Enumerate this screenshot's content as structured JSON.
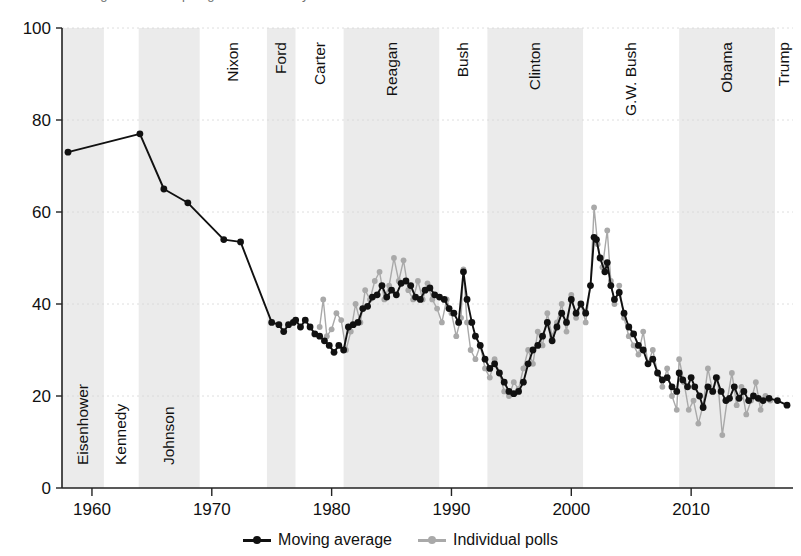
{
  "top_cut_text": "is this data straight from Gallup Organization surveys",
  "legend": {
    "series": [
      {
        "name": "moving-average",
        "label": "Moving average",
        "color": "#111111"
      },
      {
        "name": "individual-polls",
        "label": "Individual polls",
        "color": "#a9a9a9"
      }
    ]
  },
  "chart_data": {
    "type": "line",
    "title": "",
    "xlabel": "",
    "ylabel": "",
    "xlim": [
      1957.5,
      2018.5
    ],
    "ylim": [
      0,
      100
    ],
    "grid": true,
    "grid_axis": "y",
    "legend_position": "bottom-center",
    "xticks": [
      1960,
      1970,
      1980,
      1990,
      2000,
      2010
    ],
    "yticks": [
      0,
      20,
      40,
      60,
      80,
      100
    ],
    "band_colors": {
      "shaded": "#ebebeb",
      "plain": "#ffffff"
    },
    "presidential_bands": [
      {
        "label": "Eisenhower",
        "start": 1957.5,
        "end": 1961.0,
        "shaded": true
      },
      {
        "label": "Kennedy",
        "start": 1961.0,
        "end": 1963.9,
        "shaded": false
      },
      {
        "label": "Johnson",
        "start": 1963.9,
        "end": 1969.0,
        "shaded": true
      },
      {
        "label": "Nixon",
        "start": 1969.0,
        "end": 1974.6,
        "shaded": false
      },
      {
        "label": "Ford",
        "start": 1974.6,
        "end": 1977.0,
        "shaded": true
      },
      {
        "label": "Carter",
        "start": 1977.0,
        "end": 1981.0,
        "shaded": false
      },
      {
        "label": "Reagan",
        "start": 1981.0,
        "end": 1989.0,
        "shaded": true
      },
      {
        "label": "Bush",
        "start": 1989.0,
        "end": 1993.0,
        "shaded": false
      },
      {
        "label": "Clinton",
        "start": 1993.0,
        "end": 2001.0,
        "shaded": true
      },
      {
        "label": "G.W. Bush",
        "start": 2001.0,
        "end": 2009.0,
        "shaded": false
      },
      {
        "label": "Obama",
        "start": 2009.0,
        "end": 2017.0,
        "shaded": true
      },
      {
        "label": "Trump",
        "start": 2017.0,
        "end": 2018.5,
        "shaded": false
      }
    ],
    "series": [
      {
        "name": "Individual polls",
        "color": "#a9a9a9",
        "marker": "circle",
        "points": [
          [
            1979.0,
            35.0
          ],
          [
            1979.3,
            41.0
          ],
          [
            1979.6,
            33.0
          ],
          [
            1980.0,
            34.5
          ],
          [
            1980.4,
            38.0
          ],
          [
            1980.8,
            36.5
          ],
          [
            1981.2,
            30.0
          ],
          [
            1981.6,
            34.0
          ],
          [
            1982.0,
            40.0
          ],
          [
            1982.4,
            36.0
          ],
          [
            1982.8,
            43.0
          ],
          [
            1983.2,
            41.0
          ],
          [
            1983.6,
            45.0
          ],
          [
            1984.0,
            47.0
          ],
          [
            1984.4,
            41.0
          ],
          [
            1984.8,
            44.0
          ],
          [
            1985.2,
            50.0
          ],
          [
            1985.6,
            45.0
          ],
          [
            1986.0,
            49.5
          ],
          [
            1986.4,
            43.0
          ],
          [
            1986.8,
            41.0
          ],
          [
            1987.2,
            45.0
          ],
          [
            1987.6,
            41.0
          ],
          [
            1988.0,
            44.5
          ],
          [
            1988.4,
            41.0
          ],
          [
            1988.8,
            39.0
          ],
          [
            1989.2,
            36.0
          ],
          [
            1989.6,
            41.0
          ],
          [
            1990.0,
            38.0
          ],
          [
            1990.4,
            33.0
          ],
          [
            1990.8,
            37.0
          ],
          [
            1991.0,
            47.5
          ],
          [
            1991.3,
            36.0
          ],
          [
            1991.6,
            30.0
          ],
          [
            1992.0,
            28.0
          ],
          [
            1992.4,
            31.0
          ],
          [
            1992.8,
            26.0
          ],
          [
            1993.2,
            24.0
          ],
          [
            1993.6,
            28.0
          ],
          [
            1994.0,
            25.0
          ],
          [
            1994.4,
            21.0
          ],
          [
            1994.8,
            20.0
          ],
          [
            1995.2,
            23.0
          ],
          [
            1995.6,
            21.5
          ],
          [
            1996.0,
            26.0
          ],
          [
            1996.4,
            30.0
          ],
          [
            1996.8,
            27.0
          ],
          [
            1997.2,
            34.0
          ],
          [
            1997.6,
            31.0
          ],
          [
            1998.0,
            38.0
          ],
          [
            1998.4,
            33.0
          ],
          [
            1998.8,
            36.0
          ],
          [
            1999.2,
            40.0
          ],
          [
            1999.6,
            34.0
          ],
          [
            2000.0,
            42.0
          ],
          [
            2000.4,
            37.0
          ],
          [
            2000.8,
            40.0
          ],
          [
            2001.2,
            36.0
          ],
          [
            2001.6,
            44.0
          ],
          [
            2001.9,
            61.0
          ],
          [
            2002.2,
            53.0
          ],
          [
            2002.6,
            48.0
          ],
          [
            2003.0,
            56.0
          ],
          [
            2003.3,
            45.0
          ],
          [
            2003.6,
            40.0
          ],
          [
            2004.0,
            44.0
          ],
          [
            2004.4,
            37.0
          ],
          [
            2004.8,
            33.0
          ],
          [
            2005.2,
            31.0
          ],
          [
            2005.6,
            29.0
          ],
          [
            2006.0,
            34.0
          ],
          [
            2006.4,
            27.0
          ],
          [
            2006.8,
            30.0
          ],
          [
            2007.2,
            25.0
          ],
          [
            2007.6,
            22.0
          ],
          [
            2008.0,
            26.0
          ],
          [
            2008.4,
            20.0
          ],
          [
            2008.8,
            17.0
          ],
          [
            2009.0,
            28.0
          ],
          [
            2009.4,
            23.0
          ],
          [
            2009.8,
            17.0
          ],
          [
            2010.2,
            19.0
          ],
          [
            2010.6,
            14.0
          ],
          [
            2011.0,
            18.0
          ],
          [
            2011.4,
            26.0
          ],
          [
            2011.8,
            21.0
          ],
          [
            2012.2,
            24.0
          ],
          [
            2012.6,
            11.5
          ],
          [
            2013.0,
            19.0
          ],
          [
            2013.4,
            25.0
          ],
          [
            2013.8,
            18.0
          ],
          [
            2014.2,
            22.0
          ],
          [
            2014.6,
            16.0
          ],
          [
            2015.0,
            19.0
          ],
          [
            2015.4,
            23.0
          ],
          [
            2015.8,
            17.0
          ],
          [
            2016.2,
            20.0
          ],
          [
            2016.6,
            19.0
          ]
        ]
      },
      {
        "name": "Moving average",
        "color": "#111111",
        "marker": "circle",
        "points": [
          [
            1958.0,
            73.0
          ],
          [
            1964.0,
            77.0
          ],
          [
            1966.0,
            65.0
          ],
          [
            1968.0,
            62.0
          ],
          [
            1971.0,
            54.0
          ],
          [
            1972.4,
            53.5
          ],
          [
            1975.0,
            36.0
          ],
          [
            1975.6,
            35.5
          ],
          [
            1976.0,
            34.0
          ],
          [
            1976.4,
            35.5
          ],
          [
            1976.8,
            36.0
          ],
          [
            1977.0,
            36.5
          ],
          [
            1977.4,
            35.0
          ],
          [
            1977.8,
            36.5
          ],
          [
            1978.2,
            35.0
          ],
          [
            1978.6,
            33.5
          ],
          [
            1979.0,
            33.0
          ],
          [
            1979.4,
            32.0
          ],
          [
            1979.8,
            31.0
          ],
          [
            1980.2,
            29.5
          ],
          [
            1980.6,
            31.0
          ],
          [
            1981.0,
            30.0
          ],
          [
            1981.4,
            35.0
          ],
          [
            1981.8,
            35.5
          ],
          [
            1982.2,
            36.0
          ],
          [
            1982.6,
            39.0
          ],
          [
            1983.0,
            39.5
          ],
          [
            1983.4,
            41.5
          ],
          [
            1983.8,
            42.0
          ],
          [
            1984.2,
            44.0
          ],
          [
            1984.6,
            41.5
          ],
          [
            1985.0,
            43.0
          ],
          [
            1985.4,
            42.0
          ],
          [
            1985.8,
            44.5
          ],
          [
            1986.2,
            45.0
          ],
          [
            1986.6,
            44.0
          ],
          [
            1987.0,
            41.5
          ],
          [
            1987.4,
            41.0
          ],
          [
            1987.8,
            43.0
          ],
          [
            1988.2,
            43.5
          ],
          [
            1988.6,
            42.0
          ],
          [
            1989.0,
            41.5
          ],
          [
            1989.4,
            41.0
          ],
          [
            1989.8,
            39.0
          ],
          [
            1990.2,
            38.0
          ],
          [
            1990.6,
            36.0
          ],
          [
            1991.0,
            47.0
          ],
          [
            1991.3,
            41.0
          ],
          [
            1991.7,
            36.0
          ],
          [
            1992.0,
            33.0
          ],
          [
            1992.4,
            31.0
          ],
          [
            1992.8,
            28.0
          ],
          [
            1993.2,
            26.0
          ],
          [
            1993.6,
            27.0
          ],
          [
            1994.0,
            25.0
          ],
          [
            1994.4,
            23.0
          ],
          [
            1994.8,
            21.0
          ],
          [
            1995.2,
            20.5
          ],
          [
            1995.6,
            21.0
          ],
          [
            1996.0,
            23.0
          ],
          [
            1996.4,
            27.0
          ],
          [
            1996.8,
            30.0
          ],
          [
            1997.2,
            31.0
          ],
          [
            1997.6,
            33.0
          ],
          [
            1998.0,
            36.0
          ],
          [
            1998.4,
            32.0
          ],
          [
            1998.8,
            35.0
          ],
          [
            1999.2,
            38.0
          ],
          [
            1999.6,
            36.0
          ],
          [
            2000.0,
            41.0
          ],
          [
            2000.4,
            38.0
          ],
          [
            2000.8,
            40.0
          ],
          [
            2001.2,
            38.0
          ],
          [
            2001.6,
            44.0
          ],
          [
            2001.9,
            54.5
          ],
          [
            2002.1,
            54.0
          ],
          [
            2002.4,
            50.0
          ],
          [
            2002.8,
            47.0
          ],
          [
            2003.0,
            49.0
          ],
          [
            2003.3,
            44.0
          ],
          [
            2003.6,
            41.0
          ],
          [
            2004.0,
            42.5
          ],
          [
            2004.4,
            38.0
          ],
          [
            2004.8,
            35.0
          ],
          [
            2005.2,
            33.5
          ],
          [
            2005.6,
            31.0
          ],
          [
            2006.0,
            30.0
          ],
          [
            2006.4,
            27.0
          ],
          [
            2006.8,
            28.0
          ],
          [
            2007.2,
            25.0
          ],
          [
            2007.6,
            23.5
          ],
          [
            2008.0,
            24.0
          ],
          [
            2008.4,
            22.0
          ],
          [
            2008.8,
            21.0
          ],
          [
            2009.0,
            25.0
          ],
          [
            2009.3,
            23.5
          ],
          [
            2009.7,
            22.0
          ],
          [
            2010.0,
            24.0
          ],
          [
            2010.3,
            22.0
          ],
          [
            2010.7,
            20.0
          ],
          [
            2011.0,
            17.5
          ],
          [
            2011.4,
            22.0
          ],
          [
            2011.8,
            21.0
          ],
          [
            2012.1,
            24.0
          ],
          [
            2012.5,
            21.0
          ],
          [
            2012.9,
            19.0
          ],
          [
            2013.2,
            19.5
          ],
          [
            2013.6,
            22.0
          ],
          [
            2014.0,
            19.5
          ],
          [
            2014.4,
            21.0
          ],
          [
            2014.8,
            19.0
          ],
          [
            2015.2,
            20.0
          ],
          [
            2015.6,
            19.5
          ],
          [
            2016.0,
            19.0
          ],
          [
            2016.5,
            19.5
          ],
          [
            2017.2,
            19.0
          ],
          [
            2018.0,
            18.0
          ]
        ]
      }
    ]
  }
}
